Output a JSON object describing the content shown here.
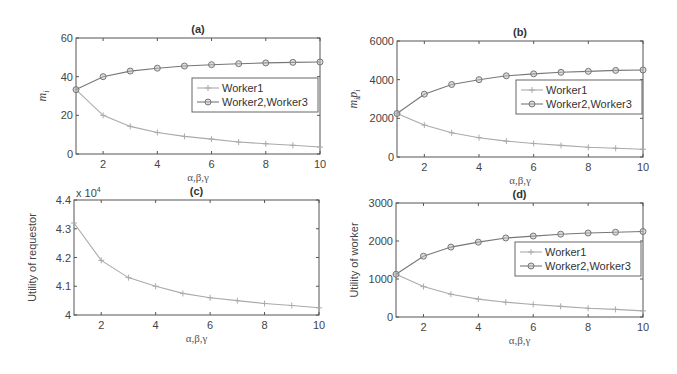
{
  "chart_data": [
    {
      "id": "a",
      "type": "line",
      "title": "(a)",
      "xlabel": "α,β,γ",
      "ylabel": "m_i",
      "x": [
        1,
        2,
        3,
        4,
        5,
        6,
        7,
        8,
        9,
        10
      ],
      "xlim": [
        1,
        10
      ],
      "ylim": [
        0,
        60
      ],
      "xticks": [
        2,
        4,
        6,
        8,
        10
      ],
      "yticks": [
        0,
        20,
        40,
        60
      ],
      "grid": false,
      "legend_position": "center-right",
      "series": [
        {
          "name": "Worker1",
          "marker": "plus",
          "color": "#aaaaaa",
          "values": [
            33.3,
            20,
            14.3,
            11.1,
            9.1,
            7.7,
            6.2,
            5.3,
            4.5,
            3.6
          ]
        },
        {
          "name": "Worker2,Worker3",
          "marker": "circle",
          "color": "#777777",
          "values": [
            33.3,
            40,
            42.9,
            44.4,
            45.5,
            46.2,
            46.7,
            47.1,
            47.4,
            47.6
          ]
        }
      ]
    },
    {
      "id": "b",
      "type": "line",
      "title": "(b)",
      "xlabel": "α,β,γ",
      "ylabel": "m_i p_i",
      "x": [
        1,
        2,
        3,
        4,
        5,
        6,
        7,
        8,
        9,
        10
      ],
      "xlim": [
        1,
        10
      ],
      "ylim": [
        0,
        6000
      ],
      "xticks": [
        2,
        4,
        6,
        8,
        10
      ],
      "yticks": [
        0,
        2000,
        4000,
        6000
      ],
      "grid": false,
      "legend_position": "center-right",
      "series": [
        {
          "name": "Worker1",
          "marker": "plus",
          "color": "#aaaaaa",
          "values": [
            2250,
            1650,
            1250,
            1000,
            820,
            700,
            600,
            500,
            450,
            400
          ]
        },
        {
          "name": "Worker2,Worker3",
          "marker": "circle",
          "color": "#777777",
          "values": [
            2250,
            3250,
            3750,
            4000,
            4200,
            4300,
            4380,
            4430,
            4480,
            4500
          ]
        }
      ]
    },
    {
      "id": "c",
      "type": "line",
      "title": "(c)",
      "xlabel": "α,β,γ",
      "ylabel": "Utility of requestor",
      "y_multiplier": "x 10^4",
      "x": [
        1,
        2,
        3,
        4,
        5,
        6,
        7,
        8,
        9,
        10
      ],
      "xlim": [
        1,
        10
      ],
      "ylim": [
        4.0,
        4.4
      ],
      "xticks": [
        2,
        4,
        6,
        8,
        10
      ],
      "yticks": [
        4,
        4.1,
        4.2,
        4.3,
        4.4
      ],
      "grid": false,
      "series": [
        {
          "name": "Requestor",
          "marker": "plus",
          "color": "#aaaaaa",
          "values": [
            4.32,
            4.19,
            4.13,
            4.1,
            4.075,
            4.06,
            4.05,
            4.04,
            4.033,
            4.025
          ]
        }
      ]
    },
    {
      "id": "d",
      "type": "line",
      "title": "(d)",
      "xlabel": "α,β,γ",
      "ylabel": "Utility of worker",
      "x": [
        1,
        2,
        3,
        4,
        5,
        6,
        7,
        8,
        9,
        10
      ],
      "xlim": [
        1,
        10
      ],
      "ylim": [
        0,
        3000
      ],
      "xticks": [
        2,
        4,
        6,
        8,
        10
      ],
      "yticks": [
        0,
        1000,
        2000,
        3000
      ],
      "grid": false,
      "legend_position": "center-right",
      "series": [
        {
          "name": "Worker1",
          "marker": "plus",
          "color": "#aaaaaa",
          "values": [
            1125,
            800,
            600,
            470,
            390,
            330,
            280,
            230,
            200,
            160
          ]
        },
        {
          "name": "Worker2,Worker3",
          "marker": "circle",
          "color": "#777777",
          "values": [
            1125,
            1600,
            1840,
            1970,
            2080,
            2130,
            2180,
            2210,
            2230,
            2250
          ]
        }
      ]
    }
  ],
  "layout": [
    {
      "left": 76,
      "right": 320,
      "top": 38,
      "bottom": 154,
      "legend": {
        "x": 192,
        "y": 78,
        "w": 126,
        "h": 34
      }
    },
    {
      "left": 397,
      "right": 643,
      "top": 41,
      "bottom": 157,
      "legend": {
        "x": 516,
        "y": 80,
        "w": 126,
        "h": 34
      }
    },
    {
      "left": 74,
      "right": 319,
      "top": 200,
      "bottom": 315,
      "legend": null
    },
    {
      "left": 396,
      "right": 643,
      "top": 203,
      "bottom": 317,
      "legend": {
        "x": 515,
        "y": 242,
        "w": 126,
        "h": 34
      }
    }
  ],
  "labels": {
    "ylabel_a_main": "m",
    "ylabel_a_sub": "i",
    "ylabel_b_m": "m",
    "ylabel_b_sub1": "i",
    "ylabel_b_p": "p",
    "ylabel_b_sub2": "i",
    "multiplier_base": "x 10",
    "multiplier_exp": "4"
  }
}
